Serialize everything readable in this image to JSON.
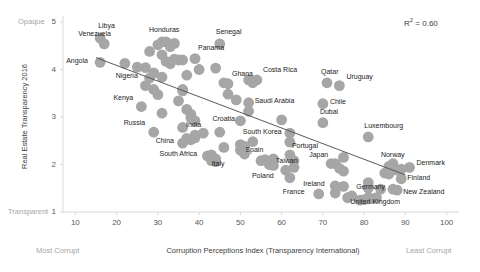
{
  "chart_data": {
    "type": "scatter",
    "title": "",
    "xlabel": "Corruption Perceptions Index (Transparency International)",
    "ylabel": "Real Estate Transparency 2016",
    "xlim": [
      7,
      103
    ],
    "ylim": [
      1,
      5
    ],
    "xticks": [
      10,
      20,
      30,
      40,
      50,
      60,
      70,
      80,
      90,
      100
    ],
    "yticks": [
      1,
      2,
      3,
      4,
      5
    ],
    "grid": false,
    "legend": null,
    "annotations": {
      "r2": "R² = 0.60",
      "y_axis_top_cap": "Opaque",
      "y_axis_bottom_cap": "Transparent",
      "x_axis_left_cap": "Most Corrupt",
      "x_axis_right_cap": "Least Corrupt"
    },
    "trendline": {
      "x": [
        15,
        90
      ],
      "y": [
        4.25,
        1.78
      ],
      "color": "#595959"
    },
    "marker": {
      "color": "#a6a6a6",
      "shape": "circle",
      "size": 5.4
    },
    "labeled_points": [
      {
        "label": "Libya",
        "x": 16,
        "y": 4.66,
        "lx": -2,
        "ly": -12
      },
      {
        "label": "Venezuela",
        "x": 17,
        "y": 4.54,
        "lx": -26,
        "ly": -10
      },
      {
        "label": "Angola",
        "x": 16,
        "y": 4.15,
        "lx": -34,
        "ly": -1
      },
      {
        "label": "Nigeria",
        "x": 28,
        "y": 3.82,
        "lx": -34,
        "ly": -2
      },
      {
        "label": "Kenya",
        "x": 26,
        "y": 3.22,
        "lx": -28,
        "ly": -9
      },
      {
        "label": "Russia",
        "x": 29,
        "y": 2.68,
        "lx": -30,
        "ly": -9
      },
      {
        "label": "China",
        "x": 36,
        "y": 2.45,
        "lx": -27,
        "ly": -2
      },
      {
        "label": "South Africa",
        "x": 43,
        "y": 2.2,
        "lx": -52,
        "ly": -1
      },
      {
        "label": "India",
        "x": 39,
        "y": 2.62,
        "lx": -9,
        "ly": -10
      },
      {
        "label": "Italy",
        "x": 44,
        "y": 2.06,
        "lx": -4,
        "ly": 2
      },
      {
        "label": "Honduras",
        "x": 31,
        "y": 4.58,
        "lx": -13,
        "ly": -12
      },
      {
        "label": "Panama",
        "x": 39,
        "y": 4.23,
        "lx": 3,
        "ly": -11
      },
      {
        "label": "Senegal",
        "x": 45,
        "y": 4.54,
        "lx": -4,
        "ly": -12
      },
      {
        "label": "Ghana",
        "x": 47,
        "y": 3.7,
        "lx": 4,
        "ly": -10
      },
      {
        "label": "Costa Rica",
        "x": 54,
        "y": 3.78,
        "lx": 6,
        "ly": -10
      },
      {
        "label": "Saudi Arabia",
        "x": 52,
        "y": 3.3,
        "lx": 6,
        "ly": -2
      },
      {
        "label": "Croatia",
        "x": 50,
        "y": 2.92,
        "lx": -28,
        "ly": -2
      },
      {
        "label": "South Korea",
        "x": 53,
        "y": 2.48,
        "lx": -10,
        "ly": -10
      },
      {
        "label": "Spain",
        "x": 58,
        "y": 2.12,
        "lx": -28,
        "ly": -9
      },
      {
        "label": "Taiwan",
        "x": 61,
        "y": 1.88,
        "lx": -10,
        "ly": -9
      },
      {
        "label": "Poland",
        "x": 62,
        "y": 1.72,
        "lx": -38,
        "ly": -2
      },
      {
        "label": "Portugal",
        "x": 62,
        "y": 2.2,
        "lx": 2,
        "ly": -9
      },
      {
        "label": "Japan",
        "x": 72,
        "y": 2.02,
        "lx": -22,
        "ly": -9
      },
      {
        "label": "France",
        "x": 69,
        "y": 1.38,
        "lx": -36,
        "ly": -2
      },
      {
        "label": "Ireland",
        "x": 73,
        "y": 1.55,
        "lx": -32,
        "ly": -2
      },
      {
        "label": "Germany",
        "x": 81,
        "y": 1.5,
        "lx": -12,
        "ly": -1
      },
      {
        "label": "United Kingdom",
        "x": 81,
        "y": 1.3,
        "lx": -18,
        "ly": 4
      },
      {
        "label": "Qatar",
        "x": 71,
        "y": 3.72,
        "lx": -6,
        "ly": -11
      },
      {
        "label": "Uruguay",
        "x": 74,
        "y": 3.66,
        "lx": 7,
        "ly": -9
      },
      {
        "label": "Chile",
        "x": 70,
        "y": 3.28,
        "lx": 7,
        "ly": -2
      },
      {
        "label": "Dubai",
        "x": 70,
        "y": 2.88,
        "lx": -3,
        "ly": -11
      },
      {
        "label": "Luxembourg",
        "x": 81,
        "y": 2.58,
        "lx": -4,
        "ly": -11
      },
      {
        "label": "Norway",
        "x": 86,
        "y": 1.96,
        "lx": -8,
        "ly": -11
      },
      {
        "label": "Denmark",
        "x": 91,
        "y": 1.94,
        "lx": 7,
        "ly": -4
      },
      {
        "label": "Finland",
        "x": 89,
        "y": 1.7,
        "lx": 6,
        "ly": -1
      },
      {
        "label": "New Zealand",
        "x": 88,
        "y": 1.46,
        "lx": 6,
        "ly": 2
      }
    ],
    "unlabeled_points": [
      {
        "x": 22,
        "y": 4.13
      },
      {
        "x": 25,
        "y": 4.05
      },
      {
        "x": 27,
        "y": 4.04
      },
      {
        "x": 28,
        "y": 4.38
      },
      {
        "x": 29,
        "y": 3.93
      },
      {
        "x": 27,
        "y": 3.66
      },
      {
        "x": 29,
        "y": 3.58
      },
      {
        "x": 30,
        "y": 4.52
      },
      {
        "x": 31,
        "y": 4.31
      },
      {
        "x": 32,
        "y": 4.58
      },
      {
        "x": 33,
        "y": 4.48
      },
      {
        "x": 34,
        "y": 4.55
      },
      {
        "x": 32,
        "y": 4.17
      },
      {
        "x": 33,
        "y": 4.12
      },
      {
        "x": 31,
        "y": 3.84
      },
      {
        "x": 30,
        "y": 3.47
      },
      {
        "x": 31,
        "y": 3.08
      },
      {
        "x": 34,
        "y": 4.22
      },
      {
        "x": 35,
        "y": 4.2
      },
      {
        "x": 36,
        "y": 4.2
      },
      {
        "x": 36,
        "y": 3.58
      },
      {
        "x": 36,
        "y": 3.55
      },
      {
        "x": 35,
        "y": 3.34
      },
      {
        "x": 37,
        "y": 3.16
      },
      {
        "x": 36,
        "y": 2.78
      },
      {
        "x": 38,
        "y": 3.06
      },
      {
        "x": 38,
        "y": 2.98
      },
      {
        "x": 39,
        "y": 2.92
      },
      {
        "x": 37,
        "y": 2.55
      },
      {
        "x": 38,
        "y": 2.52
      },
      {
        "x": 39,
        "y": 2.56
      },
      {
        "x": 37,
        "y": 3.88
      },
      {
        "x": 40,
        "y": 4.0
      },
      {
        "x": 41,
        "y": 2.66
      },
      {
        "x": 42,
        "y": 2.18
      },
      {
        "x": 43,
        "y": 2.08
      },
      {
        "x": 44,
        "y": 2.12
      },
      {
        "x": 44,
        "y": 4.03
      },
      {
        "x": 45,
        "y": 2.68
      },
      {
        "x": 46,
        "y": 3.72
      },
      {
        "x": 46,
        "y": 2.36
      },
      {
        "x": 47,
        "y": 3.48
      },
      {
        "x": 49,
        "y": 3.36
      },
      {
        "x": 50,
        "y": 2.42
      },
      {
        "x": 50,
        "y": 2.3
      },
      {
        "x": 51,
        "y": 2.38
      },
      {
        "x": 51,
        "y": 2.22
      },
      {
        "x": 52,
        "y": 3.78
      },
      {
        "x": 53,
        "y": 3.76
      },
      {
        "x": 53,
        "y": 3.72
      },
      {
        "x": 52,
        "y": 3.12
      },
      {
        "x": 55,
        "y": 2.08
      },
      {
        "x": 56,
        "y": 2.1
      },
      {
        "x": 57,
        "y": 2.0
      },
      {
        "x": 58,
        "y": 1.98
      },
      {
        "x": 60,
        "y": 2.94
      },
      {
        "x": 62,
        "y": 2.66
      },
      {
        "x": 62,
        "y": 2.47
      },
      {
        "x": 63,
        "y": 2.08
      },
      {
        "x": 63,
        "y": 1.94
      },
      {
        "x": 73,
        "y": 2.02
      },
      {
        "x": 74,
        "y": 1.92
      },
      {
        "x": 75,
        "y": 2.15
      },
      {
        "x": 75,
        "y": 1.86
      },
      {
        "x": 75,
        "y": 1.54
      },
      {
        "x": 77,
        "y": 1.34
      },
      {
        "x": 79,
        "y": 1.25
      },
      {
        "x": 80,
        "y": 1.26
      },
      {
        "x": 81,
        "y": 1.62
      },
      {
        "x": 82,
        "y": 1.28
      },
      {
        "x": 83,
        "y": 1.3
      },
      {
        "x": 84,
        "y": 1.48
      },
      {
        "x": 85,
        "y": 1.82
      },
      {
        "x": 86,
        "y": 1.8
      },
      {
        "x": 87,
        "y": 1.48
      },
      {
        "x": 87,
        "y": 2.02
      },
      {
        "x": 88,
        "y": 1.88
      },
      {
        "x": 89,
        "y": 1.9
      },
      {
        "x": 73,
        "y": 1.4
      },
      {
        "x": 76,
        "y": 1.3
      }
    ]
  }
}
